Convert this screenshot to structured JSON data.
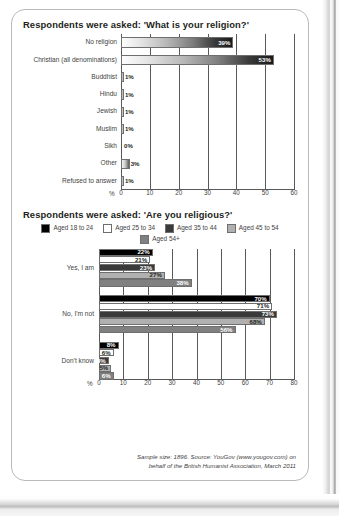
{
  "page": {
    "footnote_line1": "Sample size: 1896. Source: YouGov (www.yougov.com) on",
    "footnote_line2": "behalf of the British Humanist Association, March 2011"
  },
  "chart_data": [
    {
      "type": "bar",
      "orientation": "horizontal",
      "title": "Respondents were asked: 'What is your religion?'",
      "categories": [
        "No religion",
        "Christian (all denominations)",
        "Buddhist",
        "Hindu",
        "Jewish",
        "Muslim",
        "Sikh",
        "Other",
        "Refused to answer"
      ],
      "values": [
        39,
        53,
        1,
        1,
        1,
        1,
        0,
        3,
        1
      ],
      "labels": [
        "39%",
        "53%",
        "1%",
        "1%",
        "1%",
        "1%",
        "0%",
        "3%",
        "1%"
      ],
      "xlabel": "%",
      "ylabel": "",
      "xlim": [
        0,
        60
      ],
      "xticks": [
        0,
        10,
        20,
        30,
        40,
        50,
        60
      ],
      "grid": true,
      "legend": null,
      "bar_style": "gradient-light-to-dark"
    },
    {
      "type": "bar",
      "orientation": "horizontal",
      "grouped": true,
      "title": "Respondents were asked: 'Are you religious?'",
      "categories": [
        "Yes, I am",
        "No, I'm not",
        "Don't know"
      ],
      "series": [
        {
          "name": "Aged 18 to 24",
          "color": "#000000",
          "values": [
            22,
            70,
            8
          ],
          "labels": [
            "22%",
            "70%",
            "8%"
          ]
        },
        {
          "name": "Aged 25 to 34",
          "color": "#ffffff",
          "values": [
            21,
            71,
            6
          ],
          "labels": [
            "21%",
            "71%",
            "6%"
          ]
        },
        {
          "name": "Aged 35 to 44",
          "color": "#3a3a3a",
          "values": [
            23,
            73,
            4
          ],
          "labels": [
            "23%",
            "73%",
            "4%"
          ]
        },
        {
          "name": "Aged 45 to 54",
          "color": "#b0b0b0",
          "values": [
            27,
            68,
            5
          ],
          "labels": [
            "27%",
            "68%",
            "5%"
          ]
        },
        {
          "name": "Aged 54+",
          "color": "#808080",
          "values": [
            38,
            56,
            6
          ],
          "labels": [
            "38%",
            "56%",
            "6%"
          ]
        }
      ],
      "xlabel": "%",
      "ylabel": "",
      "xlim": [
        0,
        80
      ],
      "xticks": [
        0,
        10,
        20,
        30,
        40,
        50,
        60,
        70,
        80
      ],
      "grid": true,
      "legend_position": "top-center"
    }
  ]
}
